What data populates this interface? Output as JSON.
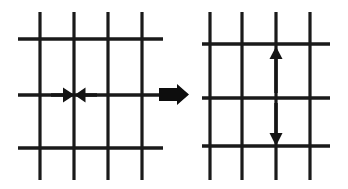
{
  "figure": {
    "background_color": "#ffffff",
    "line_color": "#1a1a1a",
    "arrow_color": "#141414",
    "width": 348,
    "height": 189,
    "description": "Two square lattice grids separated by a thick right-pointing block arrow. Left grid shows two thin arrows pointing horizontally inward toward the central vertical line (compression). Right grid shows two thin arrows pointing vertically outward from the central horizontal line (expansion)."
  },
  "panels": [
    {
      "id": "left-panel",
      "name": "before-state-grid",
      "label": "Left lattice, horizontal compression",
      "grid": {
        "vertical_lines_x": [
          40,
          74,
          108,
          142
        ],
        "horizontal_lines_y": [
          39,
          95,
          148
        ],
        "vertical_extent": [
          12,
          180
        ],
        "horizontal_extent": [
          18,
          163
        ]
      },
      "arrows": [
        {
          "id": "left-inward-arrow",
          "name": "horizontal-arrow-right",
          "direction": "right",
          "tail": [
            51,
            95
          ],
          "tip": [
            73,
            95
          ],
          "meaning": "inward compression from left"
        },
        {
          "id": "right-inward-arrow",
          "name": "horizontal-arrow-left",
          "direction": "left",
          "tail": [
            97,
            95
          ],
          "tip": [
            75,
            95
          ],
          "meaning": "inward compression from right"
        }
      ]
    },
    {
      "id": "right-panel",
      "name": "after-state-grid",
      "label": "Right lattice, vertical expansion",
      "grid": {
        "vertical_lines_x": [
          210,
          242,
          276,
          310
        ],
        "horizontal_lines_y": [
          44,
          98,
          146
        ],
        "vertical_extent": [
          12,
          180
        ],
        "horizontal_extent": [
          202,
          330
        ]
      },
      "arrows": [
        {
          "id": "up-arrow",
          "name": "vertical-arrow-up",
          "direction": "up",
          "tail": [
            276,
            93
          ],
          "tip": [
            276,
            46
          ],
          "meaning": "outward expansion upward"
        },
        {
          "id": "down-arrow",
          "name": "vertical-arrow-down",
          "direction": "down",
          "tail": [
            276,
            103
          ],
          "tip": [
            276,
            146
          ],
          "meaning": "outward expansion downward"
        }
      ]
    }
  ],
  "transition": {
    "id": "transition-arrow",
    "name": "block-arrow-right",
    "direction": "right",
    "bounds": {
      "x": 159,
      "y": 84,
      "width": 30,
      "height": 21
    },
    "color": "#0d0d0d"
  }
}
